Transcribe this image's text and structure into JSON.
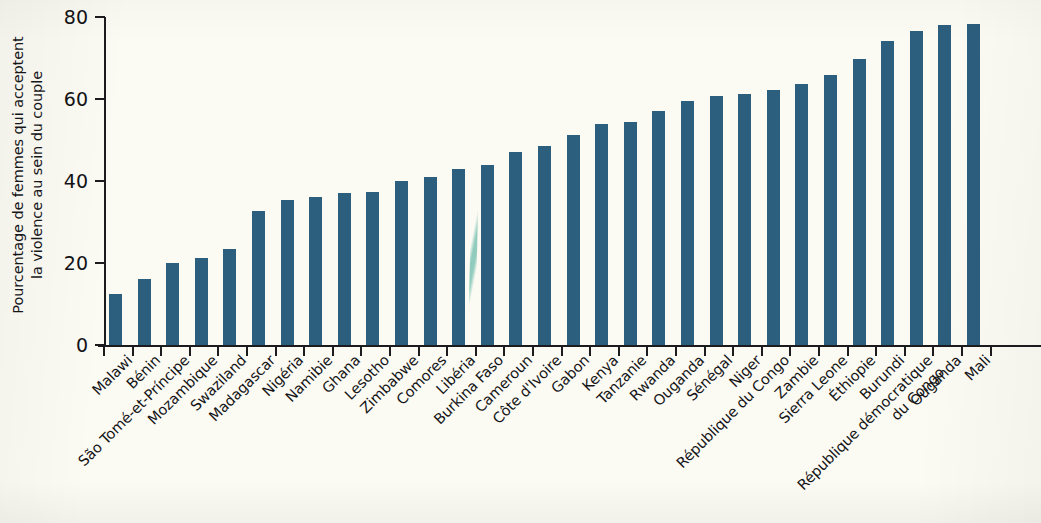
{
  "chart_data": {
    "type": "bar",
    "title": "",
    "xlabel": "",
    "ylabel": "Pourcentage de femmes qui acceptent la violence au sein du couple",
    "ylabel_lines": [
      "Pourcentage de femmes qui acceptent",
      "la violence au sein du couple"
    ],
    "ylim": [
      0,
      80
    ],
    "yticks": [
      0,
      20,
      40,
      60,
      80
    ],
    "ytick_labels": [
      "0",
      "20",
      "40",
      "60",
      "80"
    ],
    "grid": false,
    "legend": null,
    "bar_color": "#2c5e7d",
    "background_color": "#fbfaf3",
    "axis_color": "#1c1c1e",
    "categories": [
      "Malawi",
      "Bénin",
      "São Tomé-et-Príncipe",
      "Mozambique",
      "Swaziland",
      "Madagascar",
      "Nigéria",
      "Namibie",
      "Ghana",
      "Lesotho",
      "Zimbabwe",
      "Comores",
      "Libéria",
      "Burkina Faso",
      "Cameroun",
      "Côte d'Ivoire",
      "Gabon",
      "Kenya",
      "Tanzanie",
      "Rwanda",
      "Ouganda",
      "Sénégal",
      "Niger",
      "République du Congo",
      "Zambie",
      "Sierra Leone",
      "Éthiopie",
      "Burundi",
      "République démocratique du Congo",
      "Ouganda",
      "Mali"
    ],
    "category_label_lines": [
      [
        "Malawi"
      ],
      [
        "Bénin"
      ],
      [
        "São Tomé-et-Príncipe"
      ],
      [
        "Mozambique"
      ],
      [
        "Swaziland"
      ],
      [
        "Madagascar"
      ],
      [
        "Nigéria"
      ],
      [
        "Namibie"
      ],
      [
        "Ghana"
      ],
      [
        "Lesotho"
      ],
      [
        "Zimbabwe"
      ],
      [
        "Comores"
      ],
      [
        "Libéria"
      ],
      [
        "Burkina Faso"
      ],
      [
        "Cameroun"
      ],
      [
        "Côte d'Ivoire"
      ],
      [
        "Gabon"
      ],
      [
        "Kenya"
      ],
      [
        "Tanzanie"
      ],
      [
        "Rwanda"
      ],
      [
        "Ouganda"
      ],
      [
        "Sénégal"
      ],
      [
        "Niger"
      ],
      [
        "République du Congo"
      ],
      [
        "Zambie"
      ],
      [
        "Sierra Leone"
      ],
      [
        "Éthiopie"
      ],
      [
        "Burundi"
      ],
      [
        "République démocratique",
        "du Congo"
      ],
      [
        "Ouganda"
      ],
      [
        "Mali"
      ]
    ],
    "values": [
      12.5,
      16.2,
      20.0,
      21.3,
      23.4,
      32.6,
      35.3,
      36.0,
      37.0,
      37.4,
      40.0,
      41.0,
      43.0,
      44.0,
      47.0,
      48.6,
      51.2,
      53.8,
      54.5,
      57.0,
      59.4,
      60.8,
      61.2,
      62.2,
      63.7,
      65.8,
      69.7,
      74.2,
      76.5,
      78.1,
      78.2
    ]
  },
  "artifacts": {
    "fold_line": "scan-fold-line"
  }
}
